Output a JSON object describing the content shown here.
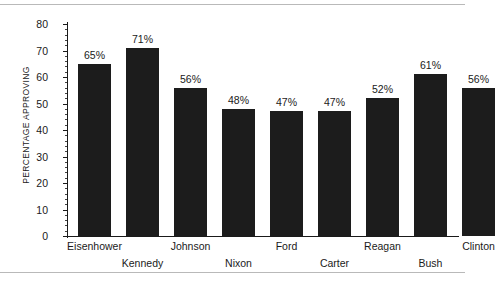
{
  "chart_data": {
    "type": "bar",
    "title": "",
    "xlabel": "",
    "ylabel": "PERCENTAGE APPROVING",
    "categories": [
      "Eisenhower",
      "Kennedy",
      "Johnson",
      "Nixon",
      "Ford",
      "Carter",
      "Reagan",
      "Bush",
      "Clinton"
    ],
    "values": [
      65,
      71,
      56,
      48,
      47,
      47,
      52,
      61,
      56
    ],
    "value_labels": [
      "65%",
      "71%",
      "56%",
      "48%",
      "47%",
      "47%",
      "52%",
      "61%",
      "56%"
    ],
    "ylim": [
      0,
      80
    ],
    "ytick_values": [
      0,
      10,
      20,
      30,
      40,
      50,
      60,
      70,
      80
    ],
    "ytick_labels": [
      "0",
      "10",
      "20",
      "30",
      "40",
      "50",
      "60",
      "70",
      "80"
    ],
    "y_major_step": 10,
    "y_minor_step": 2,
    "grid": false,
    "legend": false,
    "bar_color": "#1c1c1c",
    "axis_color": "#1a1a1a",
    "background_color": "#ffffff",
    "frame_color": "#b9b9b9",
    "label_rows": [
      0,
      1,
      0,
      1,
      0,
      1,
      0,
      1,
      0
    ]
  }
}
